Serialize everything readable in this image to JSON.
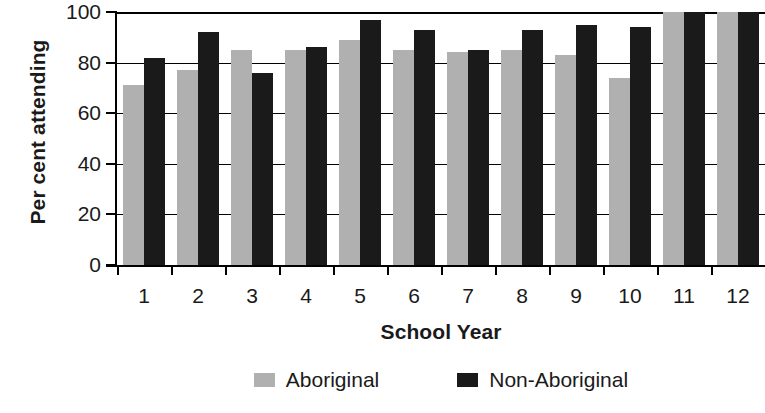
{
  "chart_data": {
    "type": "bar",
    "title": "",
    "xlabel": "School Year",
    "ylabel": "Per cent attending",
    "categories": [
      "1",
      "2",
      "3",
      "4",
      "5",
      "6",
      "7",
      "8",
      "9",
      "10",
      "11",
      "12"
    ],
    "series": [
      {
        "name": "Aboriginal",
        "color": "#b0b0b0",
        "values": [
          71,
          77,
          85,
          85,
          89,
          85,
          84,
          85,
          83,
          74,
          101,
          101
        ]
      },
      {
        "name": "Non-Aboriginal",
        "color": "#1a1a1a",
        "values": [
          82,
          92,
          76,
          86,
          97,
          93,
          85,
          93,
          95,
          94,
          101,
          101
        ]
      }
    ],
    "ylim": [
      0,
      100
    ],
    "yticks": [
      0,
      20,
      40,
      60,
      80,
      100
    ],
    "ytick_labels": [
      "0",
      "20",
      "40",
      "60",
      "80",
      "100"
    ],
    "grid": true,
    "grid_axis": "y",
    "legend_position": "bottom"
  },
  "legend": {
    "entries": [
      {
        "label": "Aboriginal",
        "color": "#b0b0b0"
      },
      {
        "label": "Non-Aboriginal",
        "color": "#1a1a1a"
      }
    ]
  }
}
